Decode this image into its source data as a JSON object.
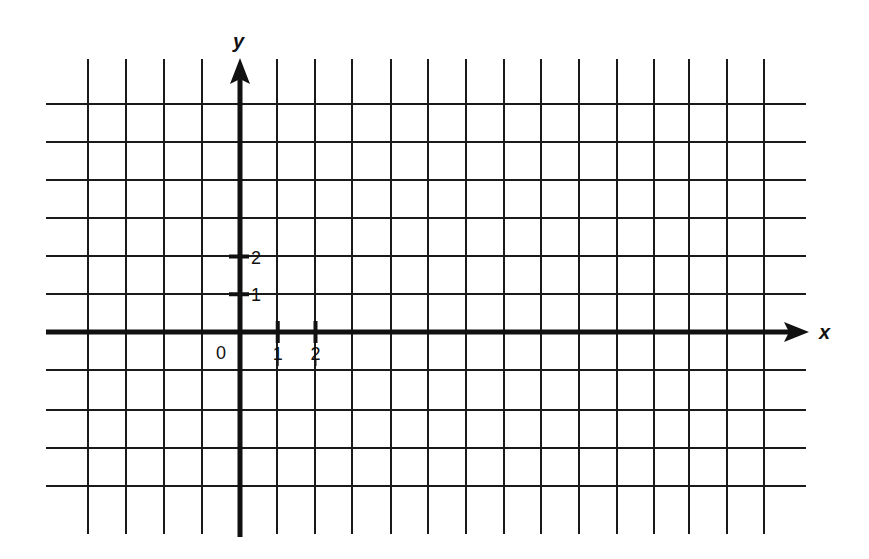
{
  "chart_data": {
    "type": "scatter",
    "title": "",
    "xlabel": "x",
    "ylabel": "y",
    "origin_label": "0",
    "x_ticks": [
      {
        "value": 1,
        "label": "1"
      },
      {
        "value": 2,
        "label": "2"
      }
    ],
    "y_ticks": [
      {
        "value": 1,
        "label": "1"
      },
      {
        "value": 2,
        "label": "2"
      }
    ],
    "xlim": [
      -5,
      14
    ],
    "ylim": [
      -5,
      6
    ],
    "grid": true,
    "series": [],
    "legend": null
  },
  "style": {
    "line_color": "#1a1a1a",
    "axis_color": "#111111",
    "background": "#ffffff"
  },
  "layout": {
    "origin_px": [
      240,
      332
    ],
    "unit_px": 37.75,
    "grid_x_px": [
      88,
      126,
      164,
      202,
      277,
      315,
      352,
      391,
      428,
      466,
      504,
      541,
      579,
      617,
      654,
      689,
      727,
      764
    ],
    "grid_y_px": [
      104,
      142,
      180,
      218,
      256,
      294,
      370,
      410,
      448,
      486
    ],
    "grid_left": 46,
    "grid_right": 806,
    "grid_top": 59,
    "grid_bottom": 534
  }
}
